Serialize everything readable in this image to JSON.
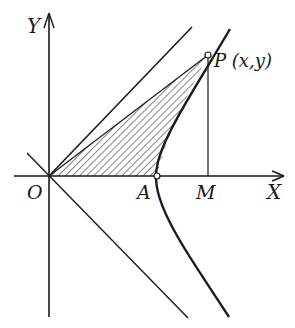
{
  "figure": {
    "type": "hyperbola-sector-diagram",
    "labels": {
      "y_axis": "Y",
      "x_axis": "X",
      "origin": "O",
      "vertex": "A",
      "foot": "M",
      "point": "P (x,y)"
    },
    "colors": {
      "ink": "#1a1a1a",
      "background": "#ffffff"
    }
  }
}
